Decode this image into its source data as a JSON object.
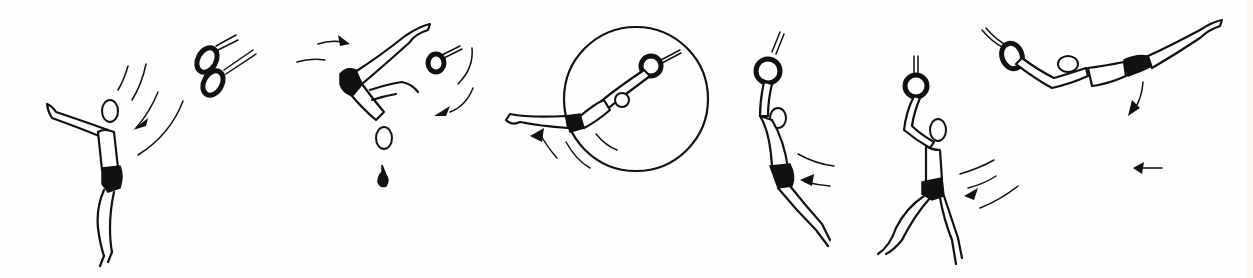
{
  "illustration": {
    "title": "Gymnastics rings swing sequence",
    "background_color": "#fefefe",
    "ink_color": "#111111",
    "frames": [
      {
        "id": 1,
        "description": "Gymnast standing, arm raised, rings swinging toward him"
      },
      {
        "id": 2,
        "description": "Gymnast inverted with legs split, ring ahead, arrows indicating rotation"
      },
      {
        "id": 3,
        "description": "Gymnast in horizontal swing inside a large circle path"
      },
      {
        "id": 4,
        "description": "Gymnast hanging from ring in a long swing, arrow to left"
      },
      {
        "id": 5,
        "description": "Gymnast hanging from ring, one leg forward, stepping"
      },
      {
        "id": 6,
        "description": "Gymnast in horizontal extended swing from ring, arrows below"
      }
    ]
  }
}
